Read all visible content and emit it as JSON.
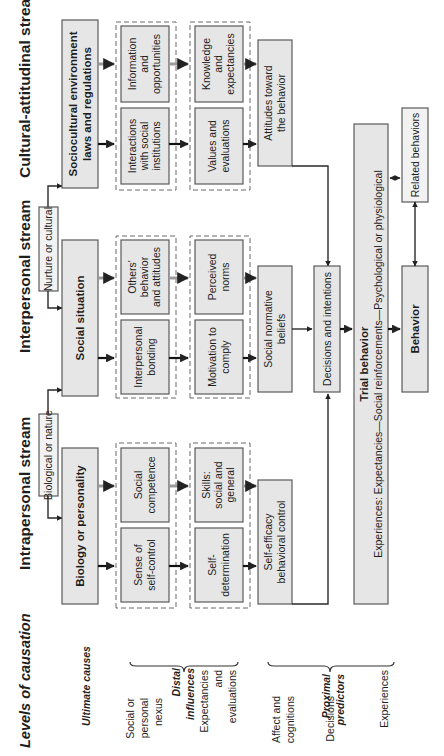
{
  "levels": {
    "title": "Levels of causation",
    "ultimate": "Ultimate causes",
    "social_personal_nexus": [
      "Social or",
      "personal",
      "nexus"
    ],
    "expectancies_evaluations": [
      "Expectancies",
      "and",
      "evaluations"
    ],
    "distal": [
      "Distal",
      "influences"
    ],
    "affect_cognitions": [
      "Affect and",
      "cognitions"
    ],
    "decisions": "Decisions",
    "experiences": "Experiences",
    "proximal": [
      "Proximal",
      "predictors"
    ]
  },
  "streams": {
    "intrapersonal": "Intrapersonal stream",
    "interpersonal": "Interpersonal stream",
    "cultural": "Cultural-attitudinal stream"
  },
  "inputs": {
    "biological": "Biological or nature",
    "nurture": "Nurture or cultural"
  },
  "ultimate_boxes": {
    "biology": "Biology or personality",
    "social_situation": "Social situation",
    "sociocultural": [
      "Sociocultural environment",
      "laws and regulations"
    ]
  },
  "nexus_boxes": {
    "self_control": [
      "Sense of",
      "self-control"
    ],
    "social_competence": [
      "Social",
      "competence"
    ],
    "interpersonal_bonding": [
      "Interpersonal",
      "bonding"
    ],
    "others_behavior": [
      "Others'",
      "behavior",
      "and attitudes"
    ],
    "interactions": [
      "Interactions",
      "with social",
      "institutions"
    ],
    "information": [
      "Information",
      "and",
      "opportunities"
    ]
  },
  "expectancy_boxes": {
    "self_determination": [
      "Self-",
      "determination"
    ],
    "skills": [
      "Skills:",
      "social and",
      "general"
    ],
    "motivation": [
      "Motivation to",
      "comply"
    ],
    "perceived_norms": [
      "Perceived",
      "norms"
    ],
    "values": [
      "Values and",
      "evaluations"
    ],
    "knowledge": [
      "Knowledge",
      "and",
      "expectancies"
    ]
  },
  "proximal_boxes": {
    "self_efficacy": [
      "Self-efficacy",
      "behavioral control"
    ],
    "social_normative": [
      "Social normative",
      "beliefs"
    ],
    "attitudes": [
      "Attitudes toward",
      "the behavior"
    ]
  },
  "decisions_box": "Decisions and intentions",
  "trial": {
    "title": "Trial behavior",
    "subtitle": "Experiences: Expectancies—Social reinforcements—Psychological or physiological"
  },
  "outcomes": {
    "behavior": "Behavior",
    "related": "Related behaviors"
  }
}
